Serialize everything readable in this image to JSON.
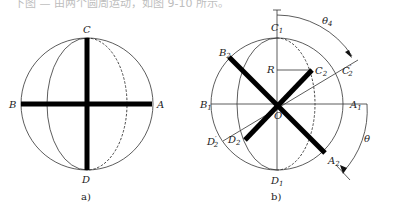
{
  "top_caption": "下图 — 由两个圆周运动，如图 9-10 所示。",
  "figure_a": {
    "caption": "a)",
    "labels": {
      "top": "C",
      "bottom": "D",
      "left": "B",
      "right": "A"
    }
  },
  "figure_b": {
    "caption": "b)",
    "labels": {
      "c1": "C",
      "c1_sub": "1",
      "d1": "D",
      "d1_sub": "1",
      "b1": "B",
      "b1_sub": "1",
      "a1": "A",
      "a1_sub": "1",
      "b2": "B",
      "b2_sub": "2",
      "c2": "C",
      "c2_sub": "2",
      "c2p": "C",
      "c2p_sub": "2",
      "c2p_prime": "′",
      "d2": "D",
      "d2_sub": "2",
      "d2p": "D",
      "d2p_sub": "2",
      "d2p_prime": "′",
      "a2": "A",
      "a2_sub": "2",
      "o": "O",
      "r": "R",
      "theta": "θ",
      "theta4": "θ",
      "theta4_sub": "4"
    }
  }
}
